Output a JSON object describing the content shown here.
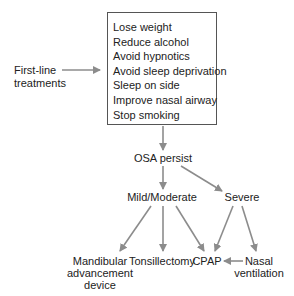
{
  "diagram": {
    "colors": {
      "arrow": "#8c8c8c",
      "box_border": "#555555",
      "text": "#222222"
    },
    "first_line": {
      "line1": "First-line",
      "line2": "treatments"
    },
    "treatment_box": {
      "items": [
        "Lose weight",
        "Reduce alcohol",
        "Avoid hypnotics",
        "Avoid sleep deprivation",
        "Sleep on side",
        "Improve nasal airway",
        "Stop smoking"
      ]
    },
    "nodes": {
      "osa_persist": "OSA persist",
      "mild_moderate": "Mild/Moderate",
      "severe": "Severe",
      "mandibular": {
        "line1": "Mandibular",
        "line2": "advancement",
        "line3": "device"
      },
      "tonsillectomy": "Tonsillectomy",
      "cpap": "CPAP",
      "nasal": {
        "line1": "Nasal",
        "line2": "ventilation"
      }
    },
    "edges": [
      {
        "from": "first_line",
        "to": "treatment_box"
      },
      {
        "from": "treatment_box",
        "to": "osa_persist"
      },
      {
        "from": "osa_persist",
        "to": "mild_moderate"
      },
      {
        "from": "osa_persist",
        "to": "severe"
      },
      {
        "from": "mild_moderate",
        "to": "mandibular"
      },
      {
        "from": "mild_moderate",
        "to": "tonsillectomy"
      },
      {
        "from": "mild_moderate",
        "to": "cpap"
      },
      {
        "from": "severe",
        "to": "cpap"
      },
      {
        "from": "severe",
        "to": "nasal"
      },
      {
        "from": "nasal",
        "to": "cpap"
      }
    ]
  }
}
